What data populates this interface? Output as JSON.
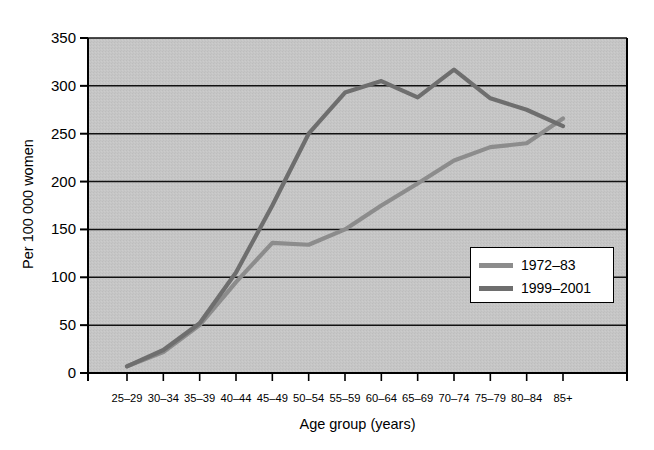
{
  "figure": {
    "top_sliver_text": "",
    "background_color": "#ffffff",
    "plot_background_color": "#c4c4c4"
  },
  "chart_data": {
    "type": "line",
    "title": "",
    "xlabel": "Age group (years)",
    "ylabel": "Per 100 000 women",
    "categories": [
      "25–29",
      "30–34",
      "35–39",
      "40–44",
      "45–49",
      "50–54",
      "55–59",
      "60–64",
      "65–69",
      "70–74",
      "75–79",
      "80–84",
      "85+"
    ],
    "ylim": [
      0,
      350
    ],
    "yticks": [
      0,
      50,
      100,
      150,
      200,
      250,
      300,
      350
    ],
    "ytick_labels": [
      "0",
      "50",
      "100",
      "150",
      "200",
      "250",
      "300",
      "350"
    ],
    "grid": "horizontal",
    "legend_position": "lower-right-inside",
    "series": [
      {
        "name": "1972–83",
        "color": "#8c8c8c",
        "values": [
          7,
          22,
          50,
          95,
          136,
          134,
          150,
          175,
          198,
          222,
          236,
          240,
          266
        ]
      },
      {
        "name": "1999–2001",
        "color": "#6e6e6e",
        "values": [
          7,
          24,
          52,
          105,
          175,
          250,
          293,
          305,
          288,
          317,
          287,
          275,
          258
        ]
      }
    ]
  }
}
